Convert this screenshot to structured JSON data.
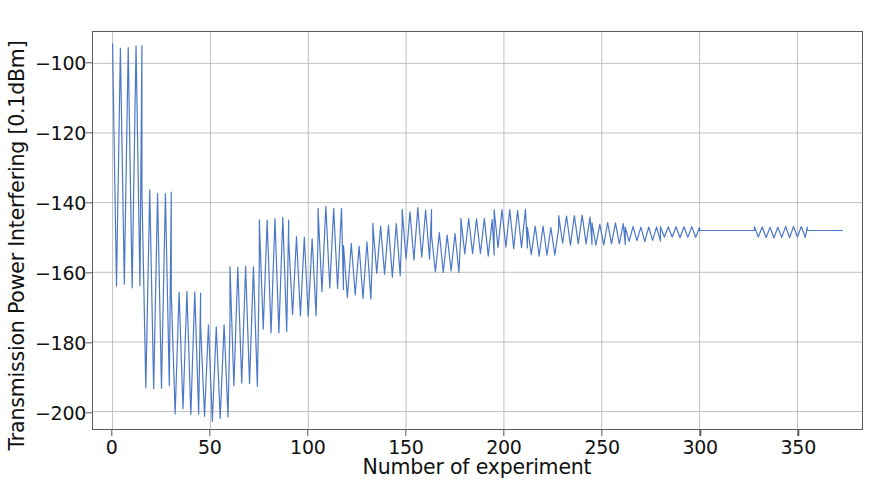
{
  "chart_data": {
    "type": "line",
    "title": "",
    "xlabel": "Number of experiment",
    "ylabel": "Transmission Power Interfering [0.1dBm]",
    "xlim": [
      -10,
      383
    ],
    "ylim": [
      -205,
      -91
    ],
    "xticks": [
      0,
      50,
      100,
      150,
      200,
      250,
      300,
      350
    ],
    "xtick_labels": [
      "0",
      "50",
      "100",
      "150",
      "200",
      "250",
      "300",
      "350"
    ],
    "yticks": [
      -100,
      -120,
      -140,
      -160,
      -180,
      -200
    ],
    "ytick_labels": [
      "−100",
      "−120",
      "−140",
      "−160",
      "−180",
      "−200"
    ],
    "grid": true,
    "grid_color": "#b9b9b9",
    "line_color": "#4C78C8",
    "line_width": 1.2,
    "legend": null,
    "annotations": [],
    "oscillation_period": 4,
    "converged_value": -148,
    "series": [
      {
        "name": "Transmission Power Interfering",
        "envelope_segments": [
          {
            "x_start": 0,
            "x_end": 15,
            "top": -95,
            "bottom": -164
          },
          {
            "x_start": 15,
            "x_end": 30,
            "top": -137,
            "bottom": -193
          },
          {
            "x_start": 30,
            "x_end": 45,
            "top": -166,
            "bottom": -200
          },
          {
            "x_start": 45,
            "x_end": 60,
            "top": -175,
            "bottom": -202
          },
          {
            "x_start": 60,
            "x_end": 75,
            "top": -158,
            "bottom": -192
          },
          {
            "x_start": 75,
            "x_end": 90,
            "top": -145,
            "bottom": -177
          },
          {
            "x_start": 90,
            "x_end": 105,
            "top": -150,
            "bottom": -172
          },
          {
            "x_start": 105,
            "x_end": 118,
            "top": -141,
            "bottom": -165
          },
          {
            "x_start": 118,
            "x_end": 133,
            "top": -152,
            "bottom": -167
          },
          {
            "x_start": 133,
            "x_end": 148,
            "top": -146,
            "bottom": -161
          },
          {
            "x_start": 148,
            "x_end": 163,
            "top": -142,
            "bottom": -156
          },
          {
            "x_start": 163,
            "x_end": 178,
            "top": -149,
            "bottom": -160
          },
          {
            "x_start": 178,
            "x_end": 195,
            "top": -145,
            "bottom": -155
          },
          {
            "x_start": 195,
            "x_end": 212,
            "top": -142,
            "bottom": -153
          },
          {
            "x_start": 212,
            "x_end": 228,
            "top": -147,
            "bottom": -155
          },
          {
            "x_start": 228,
            "x_end": 245,
            "top": -144,
            "bottom": -152
          },
          {
            "x_start": 245,
            "x_end": 262,
            "top": -146,
            "bottom": -152
          },
          {
            "x_start": 262,
            "x_end": 280,
            "top": -147,
            "bottom": -151
          },
          {
            "x_start": 280,
            "x_end": 300,
            "top": -147,
            "bottom": -150
          },
          {
            "x_start": 300,
            "x_end": 328,
            "top": -148,
            "bottom": -148
          },
          {
            "x_start": 328,
            "x_end": 355,
            "top": -147,
            "bottom": -150
          },
          {
            "x_start": 355,
            "x_end": 373,
            "top": -148,
            "bottom": -148
          }
        ]
      }
    ]
  }
}
